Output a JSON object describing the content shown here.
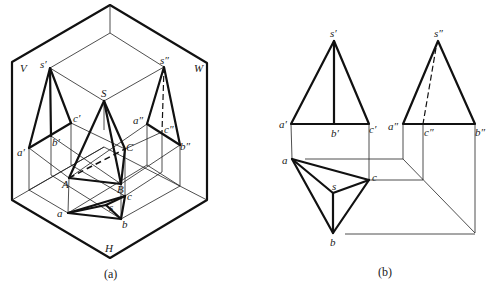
{
  "figure": {
    "panel_a": {
      "caption": "(a)",
      "plane_labels": {
        "V": "V",
        "W": "W",
        "H": "H"
      },
      "point_labels": {
        "s_prime": "s′",
        "s_double": "s″",
        "S": "S",
        "c_prime": "c′",
        "b_prime": "b′",
        "a_prime": "a′",
        "a_double": "a″",
        "c_double": "c″",
        "b_double": "b″",
        "A": "A",
        "B": "B",
        "C": "C",
        "a": "a",
        "b": "b",
        "c": "c",
        "s": "s"
      }
    },
    "panel_b": {
      "caption": "(b)",
      "point_labels": {
        "s_prime": "s′",
        "a_prime": "a′",
        "b_prime": "b′",
        "c_prime": "c′",
        "s_double": "s″",
        "a_double": "a″",
        "c_double": "c″",
        "b_double": "b″",
        "a": "a",
        "c": "c",
        "s": "s",
        "b": "b"
      }
    }
  }
}
